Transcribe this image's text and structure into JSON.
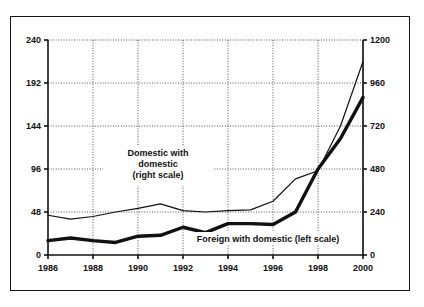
{
  "chart_data": {
    "type": "line",
    "title": "",
    "subtitle": "",
    "xlabel": "",
    "ylabel": "",
    "grid": true,
    "legend_position": "inline-annotation",
    "x": [
      1986,
      1987,
      1988,
      1989,
      1990,
      1991,
      1992,
      1993,
      1994,
      1995,
      1996,
      1997,
      1998,
      1999,
      2000
    ],
    "x_tick_labels": [
      "1986",
      "1988",
      "1990",
      "1992",
      "1994",
      "1996",
      "1998",
      "2000"
    ],
    "x_ticks": [
      1986,
      1988,
      1990,
      1992,
      1994,
      1996,
      1998,
      2000
    ],
    "xlim": [
      1986,
      2000
    ],
    "left_axis": {
      "label": "",
      "ylim": [
        0,
        240
      ],
      "ticks": [
        0,
        48,
        96,
        144,
        192,
        240
      ],
      "tick_labels": [
        "0",
        "48",
        "96",
        "144",
        "192",
        "240"
      ]
    },
    "right_axis": {
      "label": "",
      "ylim": [
        0,
        1200
      ],
      "ticks": [
        0,
        240,
        480,
        720,
        960,
        1200
      ],
      "tick_labels": [
        "0",
        "240",
        "480",
        "720",
        "960",
        "1200"
      ]
    },
    "series": [
      {
        "name": "Foreign with domestic (left scale)",
        "axis": "left",
        "style": "thick-solid",
        "color": "#111111",
        "values": [
          16,
          19,
          16,
          14,
          21,
          22,
          31,
          25,
          35,
          35,
          34,
          48,
          96,
          130,
          176
        ]
      },
      {
        "name": "Domestic with domestic (right scale)",
        "axis": "right",
        "style": "thin-solid",
        "color": "#111111",
        "values": [
          222,
          200,
          215,
          240,
          260,
          285,
          248,
          240,
          248,
          252,
          300,
          425,
          470,
          720,
          1080
        ]
      }
    ],
    "annotations": [
      {
        "name": "domestic-series-label",
        "lines": [
          "Domestic with",
          "domestic",
          "(right scale)"
        ],
        "x": 1991.1,
        "anchor": "middle"
      },
      {
        "name": "foreign-series-label",
        "lines": [
          "Foreign with domestic (left scale)"
        ],
        "x": 1996.6,
        "anchor": "middle"
      }
    ]
  },
  "axes": {
    "left_tick_labels": [
      "240",
      "192",
      "144",
      "96",
      "48",
      "0"
    ],
    "right_tick_labels": [
      "1200",
      "960",
      "720",
      "480",
      "240",
      "0"
    ],
    "x_tick_labels": [
      "1986",
      "1988",
      "1990",
      "1992",
      "1994",
      "1996",
      "1998",
      "2000"
    ]
  },
  "annotations": {
    "domestic": {
      "line1": "Domestic with",
      "line2": "domestic",
      "line3": "(right scale)"
    },
    "foreign": {
      "line1": "Foreign with domestic (left scale)"
    }
  },
  "colors": {
    "ink": "#111111",
    "frame": "#141414",
    "grid": "#2a2a2a",
    "background": "#ffffff"
  }
}
